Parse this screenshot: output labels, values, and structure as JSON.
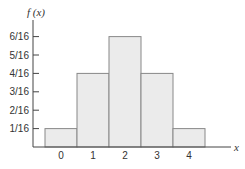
{
  "chart_data": {
    "type": "bar",
    "title": "",
    "xlabel": "x",
    "ylabel": "f (x)",
    "categories": [
      "0",
      "1",
      "2",
      "3",
      "4"
    ],
    "values": [
      0.0625,
      0.25,
      0.375,
      0.25,
      0.0625
    ],
    "value_labels": [
      "1/16",
      "4/16",
      "6/16",
      "4/16",
      "1/16"
    ],
    "y_ticks": [
      "1/16",
      "2/16",
      "3/16",
      "4/16",
      "5/16",
      "6/16"
    ],
    "ylim": [
      0,
      0.4
    ],
    "grid": false,
    "legend": null,
    "bar_color": "#ebebeb",
    "edge_color": "#888888"
  }
}
